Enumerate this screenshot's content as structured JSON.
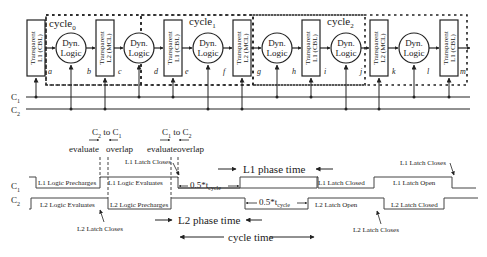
{
  "pipeline": {
    "cycles": [
      {
        "label": "cycle",
        "sub": "0"
      },
      {
        "label": "cycle",
        "sub": "1"
      },
      {
        "label": "cycle",
        "sub": "2"
      }
    ],
    "latches": [
      {
        "line1": "Transparent",
        "line2": "L1 (CBL)"
      },
      {
        "line1": "Transparent",
        "line2": "L2 (MCL)"
      },
      {
        "line1": "Transparent",
        "line2": "L1 (CBL)"
      },
      {
        "line1": "Transparent",
        "line2": "L2 (MCL)"
      },
      {
        "line1": "Transparent",
        "line2": "L1 (CBL)"
      },
      {
        "line1": "Transparent",
        "line2": "L2 (MCL)"
      },
      {
        "line1": "Transparent",
        "line2": "L1 (CBL)"
      }
    ],
    "logic_blocks": [
      {
        "line1": "Dyn.",
        "line2": "Logic"
      },
      {
        "line1": "Dyn.",
        "line2": "Logic"
      },
      {
        "line1": "Dyn.",
        "line2": "Logic"
      },
      {
        "line1": "Dyn.",
        "line2": "Logic"
      },
      {
        "line1": "Dyn.",
        "line2": "Logic"
      },
      {
        "line1": "Dyn.",
        "line2": "Logic"
      }
    ],
    "nodes": [
      "a",
      "b",
      "c",
      "d",
      "e",
      "f",
      "g",
      "h",
      "i",
      "j",
      "k",
      "l",
      "m"
    ],
    "clocks": {
      "c1": "C",
      "c1_sub": "1",
      "c2": "C",
      "c2_sub": "2"
    }
  },
  "timing": {
    "signals": {
      "c1": "C",
      "c1_sub": "1",
      "c2": "C",
      "c2_sub": "2"
    },
    "overlap1": {
      "title": "C",
      "t_sub1": "2",
      "to": " to C",
      "t_sub2": "1",
      "evaluate": "evaluate",
      "overlap": "overlap"
    },
    "overlap2": {
      "title": "C",
      "t_sub1": "1",
      "to": " to C",
      "t_sub2": "2",
      "evaluate": "evaluate",
      "overlap": "overlap"
    },
    "c1_segments": [
      "L1 Logic Precharges",
      "L1 Logic Evaluates",
      "L1 Latch Closed",
      "L1 Latch Open"
    ],
    "c2_segments": [
      "L2 Logic Evaluates",
      "L2 Logic Precharges",
      "L2 Latch Open",
      "L2 Latch Closed"
    ],
    "annotations": {
      "l1_latch_closes_1": "L1 Latch Closes",
      "l1_latch_closes_2": "L1 Latch Closes",
      "l2_latch_closes_1": "L2 Latch Closes",
      "l2_latch_closes_2": "L2 Latch Closes",
      "half_cycle": "0.5*t",
      "half_cycle_sub": "cycle",
      "l1_phase": "L1 phase time",
      "l2_phase": "L2 phase time",
      "cycle_time": "cycle time"
    }
  }
}
